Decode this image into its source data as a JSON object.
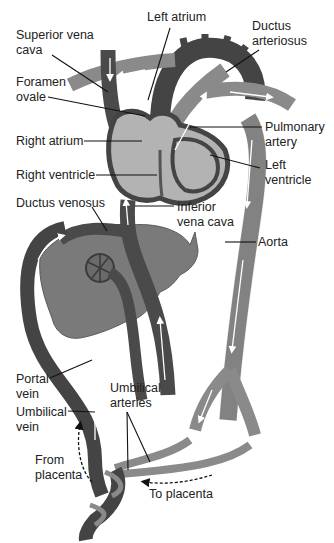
{
  "colors": {
    "vein_dark": "#4a4a4a",
    "artery_mid": "#8a8a8a",
    "heart_light": "#b3b3b3",
    "liver": "#7a7a7a",
    "outline": "#333333",
    "flow_arrow": "#ffffff",
    "leader_line": "#111111"
  },
  "labels": {
    "superior_vena_cava": "Superior vena\ncava",
    "left_atrium": "Left atrium",
    "ductus_arteriosus": "Ductus\narteriosus",
    "foramen_ovale": "Foramen\novale",
    "right_atrium": "Right atrium",
    "pulmonary_artery": "Pulmonary\nartery",
    "left_ventricle": "Left\nventricle",
    "right_ventricle": "Right ventricle",
    "ductus_venosus": "Ductus venosus",
    "inferior_vena_cava": "Inferior\nvena cava",
    "aorta": "Aorta",
    "portal_vein": "Portal\nvein",
    "umbilical_vein": "Umbilical\nvein",
    "umbilical_arteries": "Umbilical\narteries",
    "from_placenta": "From\nplacenta",
    "to_placenta": "To placenta"
  }
}
